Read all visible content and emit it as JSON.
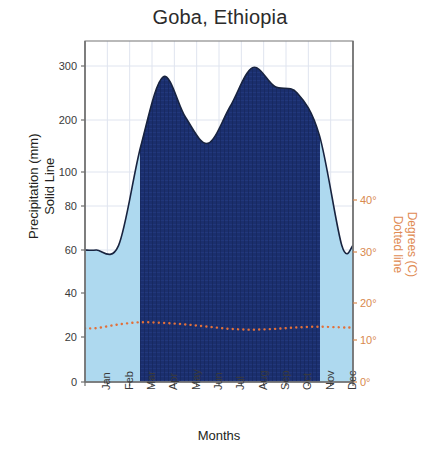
{
  "chart_data": {
    "type": "area",
    "title": "Goba, Ethiopia",
    "xlabel": "Months",
    "ylabel": "Precipitation (mm)\nSolid Line",
    "ylabel_line1": "Precipitation (mm)",
    "ylabel_line2": "Solid Line",
    "y2label_line1": "Degrees (C)",
    "y2label_line2": "Dotted line",
    "categories": [
      "Jan",
      "Feb",
      "Mar",
      "Apr",
      "May",
      "Jun",
      "Jul",
      "Aug",
      "Sep",
      "Oct",
      "Nov",
      "Dec"
    ],
    "yticks_left": [
      "0",
      "20",
      "40",
      "60",
      "80",
      "100",
      "200",
      "300"
    ],
    "yticks_right": [
      "0°",
      "10°",
      "20°",
      "30°",
      "40°"
    ],
    "ylim": [
      0,
      340
    ],
    "y2lim": [
      0,
      45
    ],
    "grid": true,
    "legend": "none",
    "series": [
      {
        "name": "Precipitation (mm)",
        "style": "solid-line-filled-area",
        "color": "#1b2f6e",
        "values": [
          60,
          62,
          150,
          280,
          205,
          155,
          225,
          297,
          262,
          250,
          170,
          62
        ]
      },
      {
        "name": "Degrees (C)",
        "style": "dotted-line",
        "color": "#e2703a",
        "values": [
          13.2,
          14.2,
          14.8,
          14.6,
          14.2,
          13.6,
          13.0,
          12.8,
          13.0,
          13.4,
          13.6,
          13.4
        ]
      }
    ],
    "annotations": {
      "wet_season_shading": "dark blue band Mar through Nov",
      "dry_season_shading": "light blue band Dec through Feb"
    },
    "colors": {
      "precip_dark": "#1b2f6e",
      "precip_light": "#aed9ef",
      "temp": "#e2703a",
      "grid": "#dfe4ef",
      "axis": "#8b8b8b",
      "title": "#2b2b2b"
    }
  }
}
